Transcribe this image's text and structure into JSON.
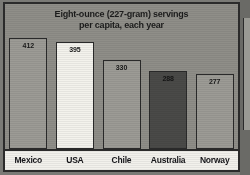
{
  "chart_data": {
    "type": "bar",
    "title": "Eight-ounce (227-gram) servings per capita, each year",
    "title_line1": "Eight-ounce (227-gram) servings",
    "title_line2": "per capita, each year",
    "xlabel": "",
    "ylabel": "",
    "ylim": [
      0,
      440
    ],
    "grid": false,
    "legend": "none",
    "categories": [
      "Mexico",
      "USA",
      "Chile",
      "Australia",
      "Norway"
    ],
    "values": [
      412,
      395,
      330,
      288,
      277
    ],
    "bar_colors": [
      "#9c9b95",
      "#f3f2ec",
      "#9c9b95",
      "#4a4a48",
      "#9c9b95"
    ],
    "value_label_colors": [
      "#1a1a1a",
      "#1a1a1a",
      "#1a1a1a",
      "#141414",
      "#1a1a1a"
    ]
  },
  "style": {
    "frame_border": "#2b2b2b",
    "plot_background": "#8f8e88",
    "label_strip_background": "#f2f1ec",
    "page_background": "#7a7a76"
  }
}
